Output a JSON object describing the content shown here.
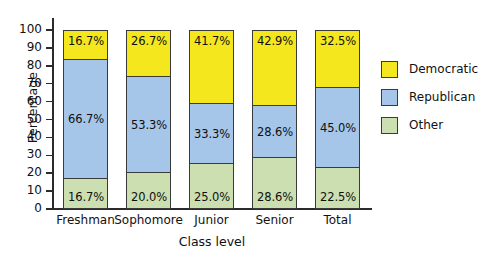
{
  "chart_data": {
    "type": "bar",
    "subtype": "stacked-100-percent",
    "title": "",
    "xlabel": "Class level",
    "ylabel": "Percentage",
    "ylim": [
      0,
      100
    ],
    "ytick_step": 10,
    "yticks": [
      "0",
      "10",
      "20",
      "30",
      "40",
      "50",
      "60",
      "70",
      "80",
      "90",
      "100"
    ],
    "grid": false,
    "legend_position": "right",
    "categories": [
      "Freshman",
      "Sophomore",
      "Junior",
      "Senior",
      "Total"
    ],
    "series": [
      {
        "name": "Democratic",
        "color": "#f5e71e",
        "values": [
          16.7,
          26.7,
          41.7,
          42.9,
          32.5
        ],
        "labels": [
          "16.7%",
          "26.7%",
          "41.7%",
          "42.9%",
          "32.5%"
        ]
      },
      {
        "name": "Republican",
        "color": "#a5c6e8",
        "values": [
          66.7,
          53.3,
          33.3,
          28.6,
          45.0
        ],
        "labels": [
          "66.7%",
          "53.3%",
          "33.3%",
          "28.6%",
          "45.0%"
        ]
      },
      {
        "name": "Other",
        "color": "#ccdfb0",
        "values": [
          16.7,
          20.0,
          25.0,
          28.6,
          22.5
        ],
        "labels": [
          "16.7%",
          "20.0%",
          "25.0%",
          "28.6%",
          "22.5%"
        ]
      }
    ]
  },
  "legend": {
    "items": [
      {
        "label": "Democratic",
        "color": "#f5e71e"
      },
      {
        "label": "Republican",
        "color": "#a5c6e8"
      },
      {
        "label": "Other",
        "color": "#ccdfb0"
      }
    ]
  },
  "axes": {
    "y_title": "Percentage",
    "x_title": "Class level"
  }
}
